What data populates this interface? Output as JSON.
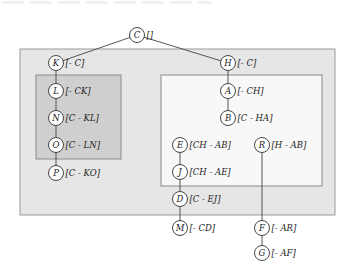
{
  "diagram": {
    "type": "tree",
    "colors": {
      "outer_box_fill": "#e6e6e6",
      "outer_box_stroke": "#9a9a9a",
      "left_box_fill": "#cfcfcf",
      "left_box_stroke": "#8a8a8a",
      "right_box_fill": "#f8f8f8",
      "right_box_stroke": "#8a8a8a",
      "node_fill": "#ffffff",
      "node_stroke": "#333333",
      "edge": "#444444"
    },
    "boxes": [
      {
        "id": "outer",
        "x": 20,
        "y": 49,
        "w": 315,
        "h": 166
      },
      {
        "id": "left",
        "x": 36,
        "y": 75,
        "w": 85,
        "h": 84
      },
      {
        "id": "right",
        "x": 161,
        "y": 75,
        "w": 161,
        "h": 111
      }
    ],
    "nodes": [
      {
        "id": "C",
        "label": "C",
        "set": "[]",
        "x": 137,
        "y": 35
      },
      {
        "id": "K",
        "label": "K",
        "set": "[- C]",
        "x": 56,
        "y": 63
      },
      {
        "id": "L",
        "label": "L",
        "set": "[- CK]",
        "x": 56,
        "y": 91
      },
      {
        "id": "N",
        "label": "N",
        "set": "[C - KL]",
        "x": 56,
        "y": 118
      },
      {
        "id": "O",
        "label": "O",
        "set": "[C - LN]",
        "x": 56,
        "y": 145
      },
      {
        "id": "P",
        "label": "P",
        "set": "[C - KO]",
        "x": 56,
        "y": 173
      },
      {
        "id": "H",
        "label": "H",
        "set": "[- C]",
        "x": 228,
        "y": 63
      },
      {
        "id": "A",
        "label": "A",
        "set": "[- CH]",
        "x": 228,
        "y": 91
      },
      {
        "id": "B",
        "label": "B",
        "set": "[C - HA]",
        "x": 228,
        "y": 118
      },
      {
        "id": "E",
        "label": "E",
        "set": "[CH - AB]",
        "x": 180,
        "y": 145
      },
      {
        "id": "R",
        "label": "R",
        "set": "[H - AB]",
        "x": 262,
        "y": 145
      },
      {
        "id": "J",
        "label": "J",
        "set": "[CH - AE]",
        "x": 180,
        "y": 172
      },
      {
        "id": "D",
        "label": "D",
        "set": "[C - EJ]",
        "x": 180,
        "y": 199
      },
      {
        "id": "M",
        "label": "M",
        "set": "[- CD]",
        "x": 180,
        "y": 228
      },
      {
        "id": "F",
        "label": "F",
        "set": "[- AR]",
        "x": 262,
        "y": 228
      },
      {
        "id": "G",
        "label": "G",
        "set": "[- AF]",
        "x": 262,
        "y": 253
      }
    ],
    "edges": [
      [
        "C",
        "K"
      ],
      [
        "C",
        "H"
      ],
      [
        "K",
        "L"
      ],
      [
        "L",
        "N"
      ],
      [
        "N",
        "O"
      ],
      [
        "O",
        "P"
      ],
      [
        "H",
        "A"
      ],
      [
        "A",
        "B"
      ],
      [
        "E",
        "J"
      ],
      [
        "J",
        "D"
      ],
      [
        "D",
        "M"
      ],
      [
        "R",
        "F"
      ],
      [
        "F",
        "G"
      ]
    ]
  }
}
